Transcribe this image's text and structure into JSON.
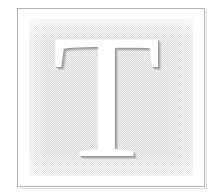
{
  "graphic": {
    "type": "decorative-drop-cap",
    "letter": "T",
    "alt_text": "Ornamental drop capital letter T",
    "frame": {
      "border_color": "#b4b4b4",
      "shadow_color": "#dcdcdc",
      "background_color": "#ffffff"
    },
    "panel": {
      "fill_style": "diagonal-dither-hatch",
      "hatch_color": "#d2d2d2",
      "base_color": "#fafafa"
    },
    "glyph": {
      "character": "T",
      "style": "serif",
      "fill_color": "#ffffff",
      "shadow_color": "#9a9a9a"
    }
  }
}
